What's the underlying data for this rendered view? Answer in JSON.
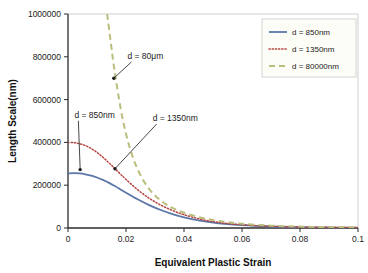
{
  "chart_data": {
    "type": "line",
    "title": "",
    "xlabel": "Equivalent Plastic Strain",
    "ylabel": "Length Scale(nm)",
    "xlim": [
      0,
      0.1
    ],
    "ylim": [
      0,
      1000000
    ],
    "grid": false,
    "legend_position": "top-right",
    "xticks": [
      "0",
      "0.02",
      "0.04",
      "0.06",
      "0.08",
      "0.1"
    ],
    "xtick_values": [
      0,
      0.02,
      0.04,
      0.06,
      0.08,
      0.1
    ],
    "yticks": [
      "0",
      "200000",
      "400000",
      "600000",
      "800000",
      "1000000"
    ],
    "ytick_values": [
      0,
      200000,
      400000,
      600000,
      800000,
      1000000
    ],
    "series": [
      {
        "name": "d = 850nm",
        "color": "#5b77a8",
        "style": "solid",
        "x": [
          0,
          0.002,
          0.004,
          0.006,
          0.008,
          0.01,
          0.012,
          0.014,
          0.016,
          0.018,
          0.02,
          0.024,
          0.028,
          0.032,
          0.036,
          0.04,
          0.046,
          0.052,
          0.06,
          0.07,
          0.08,
          0.09,
          0.1
        ],
        "y": [
          255000,
          256000,
          255000,
          251000,
          245000,
          236000,
          225000,
          212000,
          197000,
          181000,
          165000,
          134000,
          107000,
          84000,
          65000,
          50000,
          33000,
          22000,
          13000,
          7000,
          4000,
          2500,
          1500
        ]
      },
      {
        "name": "d = 1350nm",
        "color": "#b5443f",
        "style": "dotted",
        "x": [
          0,
          0.002,
          0.004,
          0.006,
          0.008,
          0.01,
          0.012,
          0.014,
          0.016,
          0.018,
          0.02,
          0.024,
          0.028,
          0.032,
          0.036,
          0.04,
          0.046,
          0.052,
          0.06,
          0.07,
          0.08,
          0.09,
          0.1
        ],
        "y": [
          400000,
          399000,
          394000,
          385000,
          371000,
          353000,
          331000,
          306000,
          280000,
          253000,
          227000,
          179000,
          139000,
          107000,
          82000,
          62000,
          40000,
          26000,
          15000,
          8000,
          4500,
          2800,
          1700
        ]
      },
      {
        "name": "d = 80000nm",
        "color": "#bcbe7d",
        "style": "dashed",
        "x": [
          0.0135,
          0.015,
          0.016,
          0.018,
          0.02,
          0.022,
          0.024,
          0.026,
          0.028,
          0.03,
          0.032,
          0.034,
          0.036,
          0.04,
          0.046,
          0.052,
          0.06,
          0.07,
          0.08,
          0.09,
          0.1
        ],
        "y": [
          1000000,
          840000,
          740000,
          570000,
          440000,
          345000,
          275000,
          222000,
          182000,
          152000,
          128000,
          109000,
          94000,
          71000,
          48000,
          33000,
          20000,
          11000,
          6500,
          4000,
          2500
        ]
      }
    ],
    "annotations": [
      {
        "label": "d = 80μm",
        "text_x": 0.0205,
        "text_y": 790000,
        "target_x": 0.0158,
        "target_y": 700000
      },
      {
        "label": "d = 850nm",
        "text_x": 0.0022,
        "text_y": 515000,
        "target_x": 0.0042,
        "target_y": 273000
      },
      {
        "label": "d = 1350nm",
        "text_x": 0.0292,
        "text_y": 500000,
        "target_x": 0.0162,
        "target_y": 277000
      }
    ]
  },
  "legend": {
    "entries": [
      {
        "label": "d = 850nm"
      },
      {
        "label": "d = 1350nm"
      },
      {
        "label": "d = 80000nm"
      }
    ]
  },
  "axes": {
    "x_title": "Equivalent Plastic Strain",
    "y_title": "Length Scale(nm)"
  }
}
